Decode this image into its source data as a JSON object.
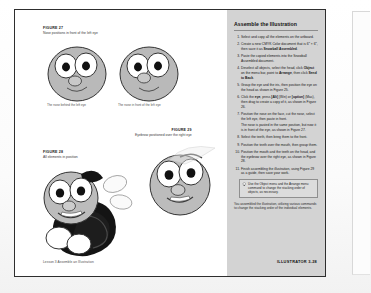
{
  "page": {
    "footer_left": "Lesson 3  Assemble an Illustration",
    "footer_right": "ILLUSTRATOR 3-28"
  },
  "figures": {
    "fig27": {
      "label": "FIGURE 27",
      "caption": "Nose positions in front of the left eye",
      "sub_left": "The nose behind the left eye",
      "sub_right": "The nose in front of the left eye"
    },
    "fig28": {
      "label": "FIGURE 28",
      "caption": "All elements in position"
    },
    "fig29": {
      "label": "FIGURE 29",
      "caption": "Eyebrow positioned over the right eye"
    }
  },
  "sidebar": {
    "title": "Assemble the Illustration",
    "steps": [
      {
        "num": "1.",
        "parts": [
          {
            "text": "Select and copy all the elements on the artboard."
          }
        ]
      },
      {
        "num": "2.",
        "parts": [
          {
            "text": "Create a new CMYK Color document that is 6″ × 6″, then save it as "
          },
          {
            "text": "Snowball Assembled",
            "bold": true
          },
          {
            "text": "."
          }
        ]
      },
      {
        "num": "3.",
        "parts": [
          {
            "text": "Paste the copied elements into the Snowball Assembled document."
          }
        ]
      },
      {
        "num": "4.",
        "parts": [
          {
            "text": "Deselect all objects, select the head, click "
          },
          {
            "text": "Object",
            "bold": true
          },
          {
            "text": " on the menu bar, point to "
          },
          {
            "text": "Arrange",
            "bold": true
          },
          {
            "text": ", then click "
          },
          {
            "text": "Send to Back",
            "bold": true
          },
          {
            "text": "."
          }
        ]
      },
      {
        "num": "5.",
        "parts": [
          {
            "text": "Group the eye and the iris, then position the eye on the head as shown in Figure 25."
          }
        ]
      },
      {
        "num": "6.",
        "parts": [
          {
            "text": "Click the "
          },
          {
            "text": "eye",
            "bold": true
          },
          {
            "text": ", press "
          },
          {
            "text": "[Alt]",
            "bold": true
          },
          {
            "text": " (Win) or "
          },
          {
            "text": "[option]",
            "bold": true
          },
          {
            "text": " (Mac), then drag to create a copy of it, as shown in Figure 26."
          }
        ]
      },
      {
        "num": "7.",
        "parts": [
          {
            "text": "Position the nose on the face, cut the nose, select the left eye, then paste in front."
          },
          {
            "text": "The nose is pasted in the same position, but now it is in front of the eye, as shown in Figure 27.",
            "para": true
          }
        ]
      },
      {
        "num": "8.",
        "parts": [
          {
            "text": "Select the teeth, then bring them to the front."
          }
        ]
      },
      {
        "num": "9.",
        "parts": [
          {
            "text": "Position the teeth over the mouth, then group them."
          }
        ]
      },
      {
        "num": "10.",
        "parts": [
          {
            "text": "Position the mouth and the teeth on the head, and the eyebrow over the right eye, as shown in Figure 28."
          }
        ]
      },
      {
        "num": "11.",
        "parts": [
          {
            "text": "Finish assembling the illustration, using Figure 29 as a guide, then save your work."
          }
        ]
      }
    ],
    "tip": {
      "icon": "lightbulb-icon",
      "text": "Use the Object menu and the Arrange menu command to change the stacking order of objects, as necessary."
    },
    "closing": "You assembled the illustration, utilizing various commands to change the stacking order of the individual elements."
  },
  "colors": {
    "sidebar_bg": "#d3d3d3",
    "page_border": "#2e2e2e",
    "tip_bg": "#dcdcdc",
    "char_fill": "#b9b9b9",
    "char_dark": "#1c1c1c"
  }
}
